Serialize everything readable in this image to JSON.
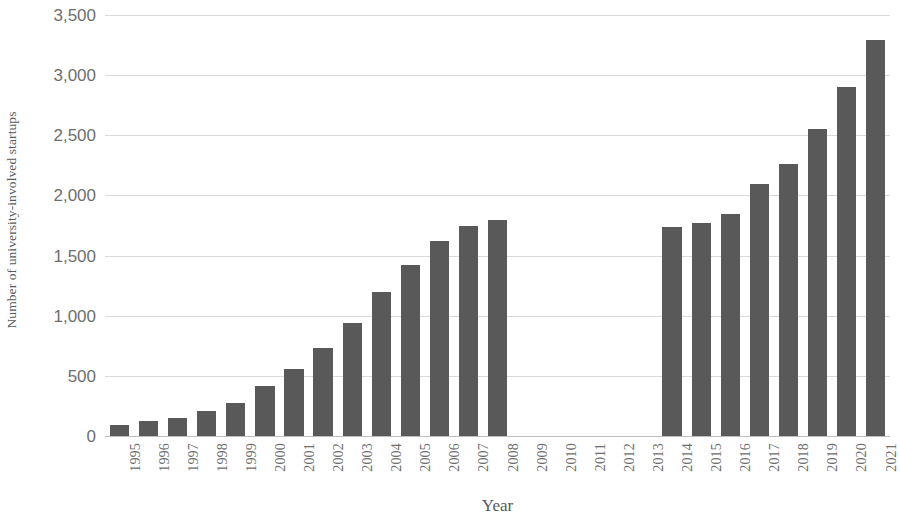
{
  "chart_data": {
    "type": "bar",
    "title": "",
    "xlabel": "Year",
    "ylabel": "Number of university-involved startups",
    "categories": [
      "1995",
      "1996",
      "1997",
      "1998",
      "1999",
      "2000",
      "2001",
      "2002",
      "2003",
      "2004",
      "2005",
      "2006",
      "2007",
      "2008",
      "2009",
      "2010",
      "2011",
      "2012",
      "2013",
      "2014",
      "2015",
      "2016",
      "2017",
      "2018",
      "2019",
      "2020",
      "2021"
    ],
    "values": [
      100,
      130,
      160,
      215,
      285,
      420,
      565,
      740,
      950,
      1205,
      1430,
      1630,
      1755,
      1805,
      null,
      null,
      null,
      null,
      null,
      1750,
      1780,
      1855,
      2100,
      2270,
      2560,
      2910,
      3300
    ],
    "ylim": [
      0,
      3500
    ],
    "ytick_values": [
      0,
      500,
      1000,
      1500,
      2000,
      2500,
      3000,
      3500
    ],
    "ytick_labels": [
      "0",
      "500",
      "1,000",
      "1,500",
      "2,000",
      "2,500",
      "3,000",
      "3,500"
    ],
    "grid": true,
    "legend": false,
    "bar_color": "#595959",
    "gridline_color": "#d9d9d9",
    "axis_text_color": "#6e6e6e",
    "missing_note": "No bars drawn for 2009-2013"
  }
}
